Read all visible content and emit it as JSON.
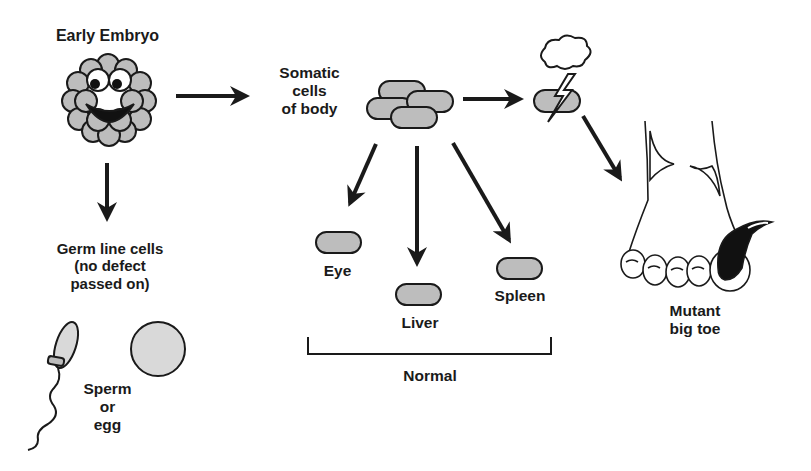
{
  "diagram": {
    "colors": {
      "ink": "#1a1a1a",
      "cell_fill": "#bdbdbd",
      "egg_fill": "#d9d9d9",
      "background": "#ffffff"
    },
    "nodes": {
      "embryo": {
        "label": "Early Embryo"
      },
      "somatic": {
        "label": "Somatic\ncells\nof body"
      },
      "germline": {
        "label": "Germ line cells\n(no defect\npassed on)"
      },
      "gametes": {
        "label": "Sperm\nor\negg"
      },
      "eye": {
        "label": "Eye"
      },
      "liver": {
        "label": "Liver"
      },
      "spleen": {
        "label": "Spleen"
      },
      "normal_group": {
        "label": "Normal"
      },
      "mutant": {
        "label": "Mutant\nbig toe"
      }
    },
    "edges": [
      {
        "from": "embryo",
        "to": "somatic"
      },
      {
        "from": "embryo",
        "to": "germline"
      },
      {
        "from": "somatic",
        "to": "mutated-cell"
      },
      {
        "from": "mutated-cell",
        "to": "mutant"
      },
      {
        "from": "somatic",
        "to": "eye"
      },
      {
        "from": "somatic",
        "to": "liver"
      },
      {
        "from": "somatic",
        "to": "spleen"
      }
    ],
    "icons": [
      "embryo-face-icon",
      "cell-cluster-icon",
      "storm-cloud-icon",
      "lightning-icon",
      "sperm-icon",
      "egg-icon",
      "foot-icon"
    ]
  }
}
